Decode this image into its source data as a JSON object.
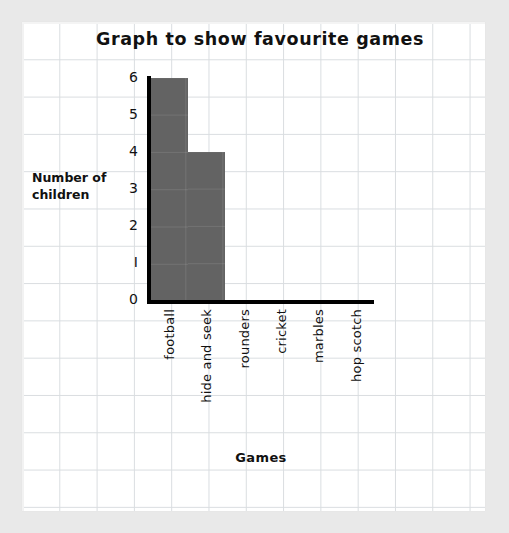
{
  "chart_data": {
    "type": "bar",
    "title": "Graph to show favourite games",
    "xlabel": "Games",
    "ylabel": "Number of children",
    "ylabel_lines": [
      "Number of",
      "children"
    ],
    "categories": [
      "football",
      "hide and seek",
      "rounders",
      "cricket",
      "marbles",
      "hop scotch"
    ],
    "values": [
      6,
      4,
      0,
      0,
      0,
      0
    ],
    "ylim": [
      0,
      6
    ],
    "ytick_labels": [
      "0",
      "I",
      "2",
      "3",
      "4",
      "5",
      "6"
    ],
    "ytick_values": [
      0,
      1,
      2,
      3,
      4,
      5,
      6
    ],
    "grid": true,
    "legend": null,
    "bar_color": "#636363",
    "axis_color": "#000000",
    "grid_color": "#d9dde0",
    "paper_color": "#ffffff",
    "background_color": "#e9e9e9"
  }
}
